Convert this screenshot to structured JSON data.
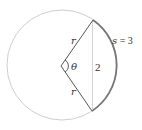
{
  "diagram": {
    "type": "circle-sector",
    "labels": {
      "radius_upper": "r",
      "radius_lower": "r",
      "angle": "θ",
      "chord": "2",
      "arc_name": "s",
      "arc_eq": " = 3"
    },
    "colors": {
      "circle": "#cfcfcf",
      "radii": "#555555",
      "arc": "#777777",
      "chord": "#d4d4d4",
      "text": "#333333"
    }
  }
}
